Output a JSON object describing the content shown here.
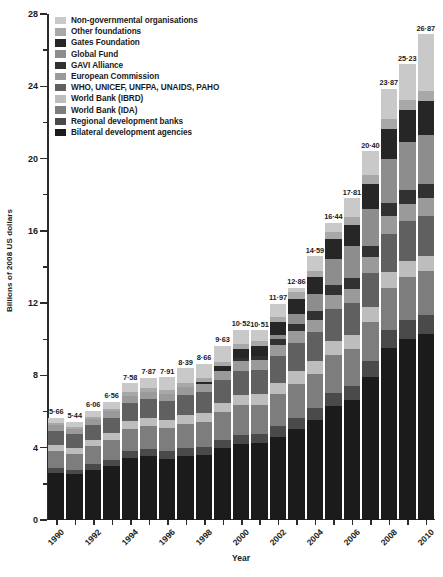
{
  "chart_data": {
    "type": "bar",
    "subtype": "stacked-vertical",
    "title": "",
    "xlabel": "Year",
    "ylabel": "Billions of 2008 US dollars",
    "ylim": [
      0,
      28
    ],
    "ytick_major": [
      0,
      4,
      8,
      12,
      16,
      20,
      24,
      28
    ],
    "ytick_minor": [
      2,
      6,
      10,
      14,
      18,
      22,
      26
    ],
    "grid": false,
    "legend_position": "top-left-inside",
    "categories": [
      "1990",
      "1991",
      "1992",
      "1993",
      "1994",
      "1995",
      "1996",
      "1997",
      "1998",
      "1999",
      "2000",
      "2001",
      "2002",
      "2003",
      "2004",
      "2005",
      "2006",
      "2007",
      "2008",
      "2009",
      "2010"
    ],
    "xtick_labels": [
      "1990",
      "1992",
      "1994",
      "1996",
      "1998",
      "2000",
      "2002",
      "2004",
      "2006",
      "2008",
      "2010"
    ],
    "totals": [
      5.66,
      5.44,
      6.06,
      6.56,
      7.58,
      7.87,
      7.91,
      8.39,
      8.66,
      9.63,
      10.52,
      10.51,
      11.97,
      12.86,
      14.59,
      16.44,
      17.81,
      20.4,
      23.87,
      25.23,
      26.87
    ],
    "total_labels": [
      "5·66",
      "5·44",
      "6·06",
      "6·56",
      "7·58",
      "7·87",
      "7·91",
      "8·39",
      "8·66",
      "9·63",
      "10·52",
      "10·51",
      "11·97",
      "12·86",
      "14·59",
      "16·44",
      "17·81",
      "20·40",
      "23·87",
      "25·23",
      "26·87"
    ],
    "series": [
      {
        "name": "Bilateral development agencies",
        "color": "#1b1b1b",
        "values": [
          2.6,
          2.52,
          2.79,
          3.0,
          3.45,
          3.52,
          3.4,
          3.55,
          3.62,
          3.96,
          4.2,
          4.25,
          4.6,
          5.05,
          5.9,
          6.7,
          7.4,
          8.9,
          10.5,
          11.2,
          11.8
        ]
      },
      {
        "name": "Regional development banks",
        "color": "#4a4a4a",
        "values": [
          0.28,
          0.26,
          0.3,
          0.33,
          0.38,
          0.4,
          0.41,
          0.43,
          0.44,
          0.48,
          0.52,
          0.52,
          0.58,
          0.62,
          0.7,
          0.78,
          0.84,
          0.96,
          1.1,
          1.16,
          1.22
        ]
      },
      {
        "name": "World Bank (IDA)",
        "color": "#7d7d7d",
        "values": [
          0.95,
          0.9,
          1.0,
          1.08,
          1.22,
          1.26,
          1.27,
          1.34,
          1.38,
          1.52,
          1.62,
          1.6,
          1.78,
          1.88,
          2.05,
          2.2,
          2.3,
          2.45,
          2.6,
          2.7,
          2.78
        ]
      },
      {
        "name": "World Bank (IBRD)",
        "color": "#bdbdbd",
        "values": [
          0.34,
          0.32,
          0.36,
          0.38,
          0.44,
          0.46,
          0.46,
          0.48,
          0.5,
          0.54,
          0.58,
          0.58,
          0.64,
          0.68,
          0.74,
          0.8,
          0.84,
          0.9,
          0.96,
          0.98,
          1.0
        ]
      },
      {
        "name": "WHO, UNICEF, UNFPA, UNAIDS, PAHO",
        "color": "#606060",
        "values": [
          0.78,
          0.74,
          0.82,
          0.88,
          1.0,
          1.03,
          1.04,
          1.1,
          1.14,
          1.24,
          1.34,
          1.33,
          1.46,
          1.56,
          1.72,
          1.88,
          1.98,
          2.15,
          2.35,
          2.45,
          2.55
        ]
      },
      {
        "name": "European Commission",
        "color": "#9a9a9a",
        "values": [
          0.3,
          0.28,
          0.32,
          0.34,
          0.4,
          0.42,
          0.42,
          0.45,
          0.46,
          0.5,
          0.56,
          0.56,
          0.62,
          0.66,
          0.74,
          0.82,
          0.88,
          0.96,
          1.06,
          1.1,
          1.14
        ]
      },
      {
        "name": "GAVI Alliance",
        "color": "#313131",
        "values": [
          0.0,
          0.0,
          0.0,
          0.0,
          0.0,
          0.0,
          0.0,
          0.0,
          0.0,
          0.0,
          0.14,
          0.22,
          0.34,
          0.42,
          0.52,
          0.6,
          0.66,
          0.72,
          0.8,
          0.84,
          0.88
        ]
      },
      {
        "name": "Global Fund",
        "color": "#8d8d8d",
        "values": [
          0.0,
          0.0,
          0.0,
          0.0,
          0.0,
          0.0,
          0.0,
          0.0,
          0.0,
          0.0,
          0.0,
          0.0,
          0.2,
          0.55,
          1.0,
          1.55,
          1.95,
          2.3,
          2.7,
          2.95,
          3.1
        ]
      },
      {
        "name": "Gates Foundation",
        "color": "#262626",
        "values": [
          0.0,
          0.0,
          0.0,
          0.0,
          0.0,
          0.0,
          0.0,
          0.0,
          0.08,
          0.28,
          0.48,
          0.56,
          0.72,
          0.84,
          0.98,
          1.15,
          1.3,
          1.55,
          1.85,
          2.0,
          2.15
        ]
      },
      {
        "name": "Other foundations",
        "color": "#a8a8a8",
        "values": [
          0.12,
          0.12,
          0.14,
          0.15,
          0.18,
          0.19,
          0.2,
          0.22,
          0.23,
          0.25,
          0.28,
          0.28,
          0.32,
          0.34,
          0.4,
          0.44,
          0.48,
          0.54,
          0.6,
          0.64,
          0.68
        ]
      },
      {
        "name": "Non-governmental organisations",
        "color": "#c9c9c9",
        "values": [
          0.29,
          0.3,
          0.33,
          0.4,
          0.51,
          0.59,
          0.71,
          0.82,
          0.81,
          0.86,
          0.8,
          0.61,
          0.71,
          0.26,
          0.84,
          0.52,
          1.18,
          1.47,
          1.85,
          2.21,
          3.57
        ]
      }
    ],
    "legend": [
      {
        "label": "Non-governmental organisations",
        "color": "#c9c9c9"
      },
      {
        "label": "Other foundations",
        "color": "#a8a8a8"
      },
      {
        "label": "Gates Foundation",
        "color": "#262626"
      },
      {
        "label": "Global Fund",
        "color": "#8d8d8d"
      },
      {
        "label": "GAVI Alliance",
        "color": "#313131"
      },
      {
        "label": "European Commission",
        "color": "#9a9a9a"
      },
      {
        "label": "WHO, UNICEF, UNFPA, UNAIDS, PAHO",
        "color": "#606060"
      },
      {
        "label": "World Bank (IBRD)",
        "color": "#bdbdbd"
      },
      {
        "label": "World Bank (IDA)",
        "color": "#7d7d7d"
      },
      {
        "label": "Regional development banks",
        "color": "#4a4a4a"
      },
      {
        "label": "Bilateral development agencies",
        "color": "#1b1b1b"
      }
    ]
  }
}
